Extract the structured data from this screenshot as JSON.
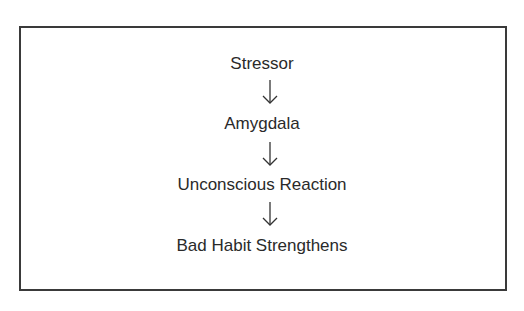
{
  "diagram": {
    "type": "flowchart",
    "direction": "top-to-bottom",
    "steps": [
      {
        "label": "Stressor"
      },
      {
        "label": "Amygdala"
      },
      {
        "label": "Unconscious Reaction"
      },
      {
        "label": "Bad Habit Strengthens"
      }
    ],
    "connector": "down-arrow"
  }
}
